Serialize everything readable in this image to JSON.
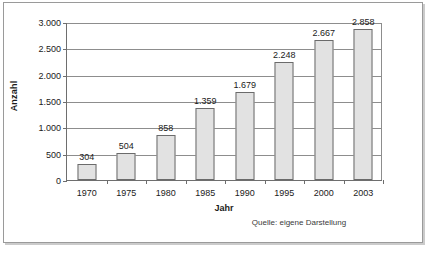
{
  "chart_data": {
    "type": "bar",
    "title": "",
    "xlabel": "Jahr",
    "ylabel": "Anzahl",
    "categories": [
      "1970",
      "1975",
      "1980",
      "1985",
      "1990",
      "1995",
      "2000",
      "2003"
    ],
    "values": [
      304,
      504,
      858,
      1359,
      1679,
      2248,
      2667,
      2858
    ],
    "value_labels": [
      "304",
      "504",
      "858",
      "1.359",
      "1.679",
      "2.248",
      "2.667",
      "2.858"
    ],
    "ylim": [
      0,
      3000
    ],
    "ytick_values": [
      0,
      500,
      1000,
      1500,
      2000,
      2500,
      3000
    ],
    "ytick_labels": [
      "0",
      "500",
      "1.000",
      "1.500",
      "2.000",
      "2.500",
      "3.000"
    ],
    "grid": true,
    "legend": "none",
    "annotations": [
      "Quelle: eigene Darstellung"
    ],
    "bar_color": "#e2e2e2",
    "bar_border_color": "#6b6b6b",
    "axis_color": "#6e6e6e",
    "gridline_color": "#8d8d8d",
    "text_color": "#1a1a1a"
  },
  "source": {
    "text": "Quelle: eigene Darstellung"
  }
}
